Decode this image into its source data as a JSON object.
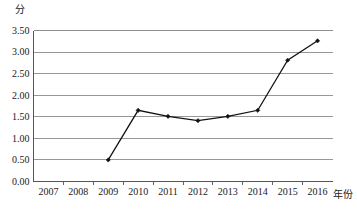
{
  "chart_data": {
    "type": "line",
    "title": "",
    "xlabel": "年份",
    "ylabel": "分",
    "categories": [
      "2007",
      "2008",
      "2009",
      "2010",
      "2011",
      "2012",
      "2013",
      "2014",
      "2015",
      "2016"
    ],
    "series": [
      {
        "name": "分",
        "values": [
          null,
          null,
          0.5,
          1.65,
          1.51,
          1.41,
          1.51,
          1.65,
          2.81,
          3.26
        ]
      }
    ],
    "ytick_labels": [
      "0.00",
      "0.50",
      "1.00",
      "1.50",
      "2.00",
      "2.50",
      "3.00",
      "3.50"
    ],
    "ytick_values": [
      0.0,
      0.5,
      1.0,
      1.5,
      2.0,
      2.5,
      3.0,
      3.5
    ],
    "ylim": [
      0.0,
      3.5
    ],
    "grid": "horizontal",
    "legend": "none",
    "marker": "diamond",
    "line_color": "#111111",
    "grid_color": "#8c8c8c",
    "axis_color": "#555555",
    "background_color": "#ffffff"
  },
  "axis": {
    "y_unit": "分",
    "x_unit": "年份"
  }
}
